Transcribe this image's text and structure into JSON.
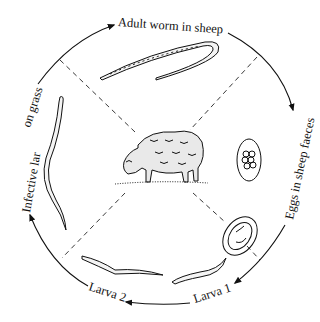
{
  "diagram": {
    "center_image": "sheep-grazing",
    "stages": [
      {
        "id": "adult",
        "label": "Adult worm in sheep",
        "illustration": "adult-worm"
      },
      {
        "id": "eggs",
        "label": "Eggs in sheep faeces",
        "illustration": "egg-cluster"
      },
      {
        "id": "larva1",
        "label": "Larva 1",
        "illustration": "egg-with-larva"
      },
      {
        "id": "larva2",
        "label": "Larva 2",
        "illustration": "larva-worm"
      },
      {
        "id": "infective",
        "label_part1": "Infective lar",
        "label_part2": "on grass",
        "illustration": "infective-larva"
      }
    ],
    "flow_direction": "clockwise"
  }
}
